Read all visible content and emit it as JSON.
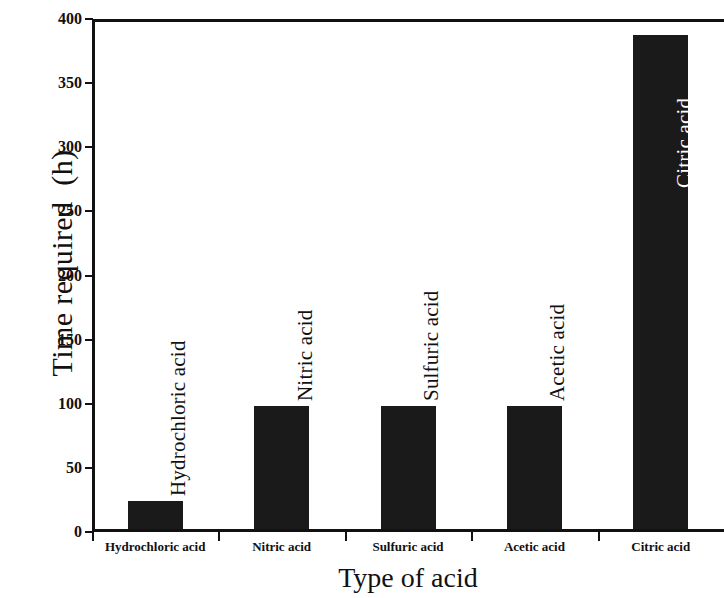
{
  "chart_data": {
    "type": "bar",
    "title": "",
    "xlabel": "Type of acid",
    "ylabel": "Time required  (h)",
    "categories": [
      "Hydrochloric acid",
      "Nitric acid",
      "Sulfuric acid",
      "Acetic acid",
      "Citric acid"
    ],
    "values": [
      22,
      96,
      96,
      96,
      385
    ],
    "ylim": [
      0,
      400
    ],
    "yticks": [
      0,
      50,
      100,
      150,
      200,
      250,
      300,
      350,
      400
    ],
    "ytick_labels": [
      "0",
      "50",
      "100",
      "150",
      "200",
      "250",
      "300",
      "350",
      "400"
    ],
    "grid": false,
    "legend": "none",
    "bar_color": "#1a1a1a",
    "axis_color": "#111111",
    "background": "#ffffff",
    "bar_annotations": [
      {
        "text": "Hydrochloric acid",
        "color": "dark",
        "inside": false
      },
      {
        "text": "Nitric acid",
        "color": "dark",
        "inside": false
      },
      {
        "text": "Sulfuric acid",
        "color": "dark",
        "inside": false
      },
      {
        "text": "Acetic acid",
        "color": "dark",
        "inside": false
      },
      {
        "text": "Citric acid",
        "color": "light",
        "inside": true
      }
    ]
  }
}
